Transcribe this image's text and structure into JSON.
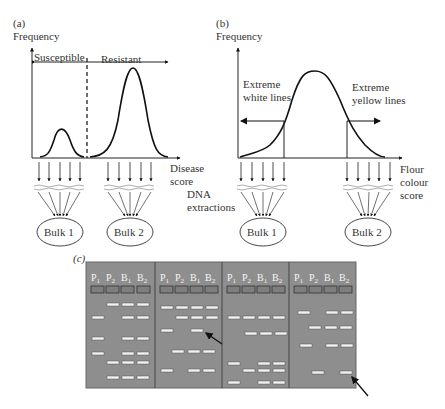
{
  "panel_a": {
    "label": "(a)",
    "ylabel": "Frequency",
    "xlabel_line1": "Disease",
    "xlabel_line2": "score",
    "region_left": "Susceptible",
    "region_right": "Resistant",
    "bulk1": "Bulk 1",
    "bulk2": "Bulk 2"
  },
  "panel_b": {
    "label": "(b)",
    "ylabel": "Frequency",
    "left_annot_line1": "Extreme",
    "left_annot_line2": "white lines",
    "right_annot_line1": "Extreme",
    "right_annot_line2": "yellow lines",
    "xlabel_line1": "Flour",
    "xlabel_line2": "colour",
    "xlabel_line3": "score",
    "bulk1": "Bulk 1",
    "bulk2": "Bulk 2"
  },
  "shared": {
    "dna_line1": "DNA",
    "dna_line2": "extractions"
  },
  "panel_c": {
    "label": "(c)",
    "lanes": [
      "P1",
      "P2",
      "B1",
      "B2"
    ],
    "gel_color": "#8e8e8e",
    "band_color": "#f2f2f2",
    "gels": [
      {
        "bands": [
          [
            1,
            0,
            1,
            1
          ],
          [
            1,
            0,
            1,
            1
          ],
          [
            1,
            0,
            1,
            1
          ],
          [
            1,
            0,
            1,
            1
          ],
          [
            0,
            1,
            1,
            1
          ],
          [
            0,
            1,
            1,
            1
          ]
        ]
      },
      {
        "bands": [
          [
            1,
            1,
            1,
            1
          ],
          [
            0,
            1,
            1,
            1
          ],
          [
            1,
            0,
            1,
            0
          ],
          [
            0,
            1,
            1,
            1
          ],
          [
            1,
            0,
            1,
            1
          ]
        ],
        "arrow_on": "P1/B1 band row 3"
      },
      {
        "bands": [
          [
            1,
            1,
            1,
            1
          ],
          [
            0,
            1,
            1,
            1
          ],
          [
            1,
            0,
            1,
            1
          ],
          [
            0,
            1,
            1,
            1
          ],
          [
            1,
            0,
            1,
            1
          ]
        ]
      },
      {
        "bands": [
          [
            1,
            0,
            1,
            1
          ],
          [
            0,
            1,
            1,
            1
          ],
          [
            1,
            0,
            1,
            1
          ],
          [
            0,
            1,
            0,
            1
          ]
        ],
        "arrow_on": "B2 band row 4"
      }
    ]
  }
}
